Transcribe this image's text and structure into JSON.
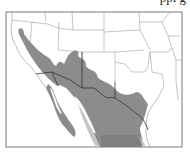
{
  "caption": "ppi g",
  "map": {
    "subject": "species range map",
    "region": "Southwestern United States and northern Mexico",
    "legend_colors": {
      "range_primary": "#8c8c8c",
      "range_secondary": "#7f7f7f",
      "range_light": "#c4c4c4",
      "land": "#ffffff",
      "boundaries": "#8a8a8a",
      "international_border": "#333333"
    }
  }
}
